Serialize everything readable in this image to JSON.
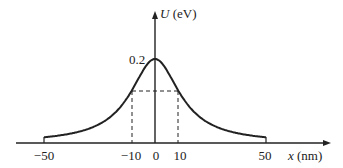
{
  "chart_data": {
    "type": "line",
    "title": "",
    "xlabel": "x (nm)",
    "ylabel": "U (eV)",
    "x_var": "x",
    "x_unit": "(nm)",
    "y_var": "U",
    "y_unit": "(eV)",
    "xticks": [
      "-50",
      "-10",
      "0",
      "10",
      "50"
    ],
    "yticks": [
      "0.2"
    ],
    "xlim": [
      -50,
      50
    ],
    "ylim": [
      0,
      0.2
    ],
    "grid": false,
    "legend": null,
    "series": [
      {
        "name": "U(x)",
        "shape": "bell-shaped (Lorentzian-like) potential barrier, peak 0.2 eV at x=0",
        "x": [
          -50,
          -40,
          -30,
          -20,
          -10,
          -5,
          0,
          5,
          10,
          20,
          30,
          40,
          50
        ],
        "values": [
          0.003,
          0.008,
          0.018,
          0.045,
          0.124,
          0.175,
          0.2,
          0.175,
          0.124,
          0.045,
          0.018,
          0.008,
          0.003
        ]
      }
    ],
    "annotations": [
      {
        "type": "dashed-guide",
        "description": "dashed lines marking curve at x = -10 nm and x = 10 nm",
        "x": [
          -10,
          10
        ],
        "y": 0.124
      }
    ]
  },
  "labels": {
    "y_var": "U",
    "y_unit": " (eV)",
    "x_var": "x",
    "x_unit": " (nm)",
    "peak": "0.2",
    "tick_m50": "−50",
    "tick_m10": "−10",
    "tick_0": "0",
    "tick_10": "10",
    "tick_50": "50"
  }
}
